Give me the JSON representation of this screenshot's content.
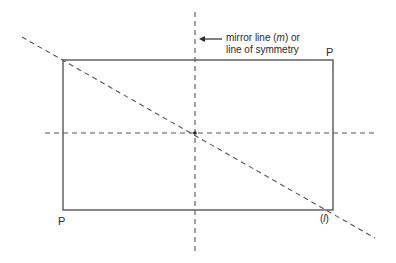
{
  "diagram": {
    "type": "geometry-symmetry",
    "colors": {
      "stroke": "#3a3a3a",
      "dash": "#555555",
      "text": "#2a2a2a",
      "background": "#ffffff"
    },
    "rectangle": {
      "x": 63,
      "y": 60,
      "width": 270,
      "height": 150
    },
    "lines": [
      {
        "id": "mirror-line-vertical",
        "style": "dashed",
        "x1": 195,
        "y1": 12,
        "x2": 195,
        "y2": 252
      },
      {
        "id": "horizontal-symmetry-line",
        "style": "dashed",
        "x1": 45,
        "y1": 133,
        "x2": 378,
        "y2": 133
      },
      {
        "id": "diagonal-line",
        "style": "dashed",
        "x1": 22,
        "y1": 37,
        "x2": 375,
        "y2": 238
      }
    ],
    "center_point": {
      "x": 195,
      "y": 133
    },
    "arrow": {
      "x1": 222,
      "y1": 39,
      "x2": 200,
      "y2": 39
    },
    "labels": {
      "mirror_line_1_prefix": "mirror line (",
      "mirror_line_1_m": "m",
      "mirror_line_1_suffix": ") or",
      "mirror_line_2": "line of symmetry",
      "p_top_right": "P",
      "p_bottom_left": "P",
      "l_open": "(",
      "l_letter": "l",
      "l_close": ")"
    }
  }
}
